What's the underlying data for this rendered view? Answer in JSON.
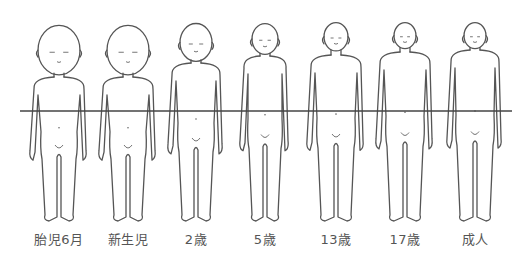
{
  "diagram": {
    "title": "",
    "midline": {
      "y": 111,
      "x1": 20,
      "x2": 512,
      "color": "#444444"
    },
    "figures": [
      {
        "label": "胎児6月",
        "cx": 59,
        "head_top": 26,
        "head_r": 21,
        "neck": 77,
        "foot": 221,
        "shoulder": 26,
        "hip": 18
      },
      {
        "label": "新生児",
        "cx": 128,
        "head_top": 26,
        "head_r": 21,
        "neck": 77,
        "foot": 221,
        "shoulder": 26,
        "hip": 18
      },
      {
        "label": "2歳",
        "cx": 196,
        "head_top": 24,
        "head_r": 16,
        "neck": 63,
        "foot": 221,
        "shoulder": 25,
        "hip": 18
      },
      {
        "label": "5歳",
        "cx": 265,
        "head_top": 24,
        "head_r": 13,
        "neck": 56,
        "foot": 221,
        "shoulder": 22,
        "hip": 17
      },
      {
        "label": "13歳",
        "cx": 336,
        "head_top": 23,
        "head_r": 12,
        "neck": 55,
        "foot": 221,
        "shoulder": 26,
        "hip": 19
      },
      {
        "label": "17歳",
        "cx": 405,
        "head_top": 23,
        "head_r": 11,
        "neck": 52,
        "foot": 221,
        "shoulder": 26,
        "hip": 19
      },
      {
        "label": "成人",
        "cx": 475,
        "head_top": 23,
        "head_r": 11,
        "neck": 50,
        "foot": 221,
        "shoulder": 25,
        "hip": 19
      }
    ]
  }
}
